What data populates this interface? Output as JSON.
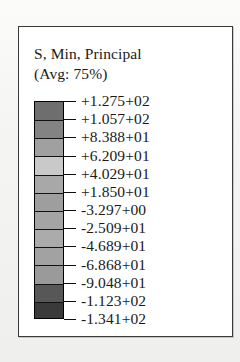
{
  "legend": {
    "title_line_1": "S, Min, Principal",
    "title_line_2": "(Avg: 75%)",
    "field": "S",
    "component": "Min, Principal",
    "averaging": "75%"
  },
  "colorbar": {
    "orientation": "vertical",
    "band_count": 12,
    "tick_count": 13,
    "band_colors": [
      "#6e6e6e",
      "#838383",
      "#a0a0a0",
      "#c9c9c9",
      "#a8a8a8",
      "#9e9e9e",
      "#a4a4a4",
      "#ababab",
      "#a2a2a2",
      "#9a9a9a",
      "#575757",
      "#3a3a3a"
    ],
    "outline_color": "#000000",
    "tick_color": "#0d0d0d"
  },
  "chart_data": {
    "type": "bar",
    "title": "S, Min, Principal (Avg: 75%)",
    "xlabel": "",
    "ylabel": "Minimum Principal Stress",
    "categories": [
      "+1.275+02",
      "+1.057+02",
      "+8.388+01",
      "+6.209+01",
      "+4.029+01",
      "+1.850+01",
      "-3.297+00",
      "-2.509+01",
      "-4.689+01",
      "-6.868+01",
      "-9.048+01",
      "-1.123+02",
      "-1.341+02"
    ],
    "values": [
      127.5,
      105.7,
      83.88,
      62.09,
      40.29,
      18.5,
      -3.297,
      -25.09,
      -46.89,
      -68.68,
      -90.48,
      -112.3,
      -134.1
    ],
    "ylim": [
      -134.1,
      127.5
    ],
    "grid": false,
    "legend_position": "none"
  },
  "tick_labels": [
    "+1.275+02",
    "+1.057+02",
    "+8.388+01",
    "+6.209+01",
    "+4.029+01",
    "+1.850+01",
    "-3.297+00",
    "-2.509+01",
    "-4.689+01",
    "-6.868+01",
    "-9.048+01",
    "-1.123+02",
    "-1.341+02"
  ]
}
